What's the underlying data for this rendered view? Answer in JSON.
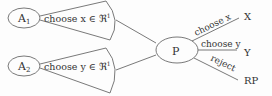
{
  "diagram": {
    "nodes": {
      "a1": {
        "label": "A",
        "sub": "1"
      },
      "a2": {
        "label": "A",
        "sub": "2"
      },
      "p": {
        "label": "P"
      },
      "x": {
        "label": "X"
      },
      "y": {
        "label": "Y"
      },
      "rp": {
        "label": "RP"
      }
    },
    "fans": {
      "a1": {
        "text": "choose x ∈ ℜ",
        "sup": "1"
      },
      "a2": {
        "text": "choose y ∈ ℜ",
        "sup": "1"
      }
    },
    "edges": {
      "choose_x": "choose x",
      "choose_y": "choose y",
      "reject": "reject"
    },
    "colors": {
      "stroke": "#6a6a6a",
      "text": "#333333"
    }
  }
}
